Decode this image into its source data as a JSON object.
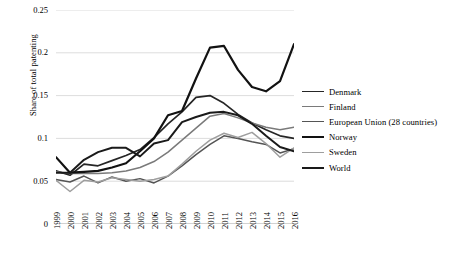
{
  "chart_data": {
    "type": "line",
    "title": "",
    "xlabel": "",
    "ylabel": "Share of total patenting",
    "ylim": [
      0,
      0.25
    ],
    "yticks": [
      "0",
      "0.05",
      "0.1",
      "0.15",
      "0.2",
      "0.25"
    ],
    "ytick_values": [
      0,
      0.05,
      0.1,
      0.15,
      0.2,
      0.25
    ],
    "grid": "horizontal",
    "legend_position": "right",
    "categories": [
      "1999",
      "2000",
      "2001",
      "2002",
      "2003",
      "2004",
      "2005",
      "2006",
      "2007",
      "2008",
      "2009",
      "2010",
      "2011",
      "2012",
      "2013",
      "2014",
      "2015",
      "2016"
    ],
    "series": [
      {
        "name": "Denmark",
        "color": "#262626",
        "width": 1.7,
        "values": [
          0.062,
          0.057,
          0.07,
          0.068,
          0.074,
          0.08,
          0.087,
          0.101,
          0.117,
          0.131,
          0.148,
          0.15,
          0.141,
          0.128,
          0.118,
          0.11,
          0.103,
          0.1
        ]
      },
      {
        "name": "Finland",
        "color": "#7a7a7a",
        "width": 1.5,
        "values": [
          0.061,
          0.059,
          0.059,
          0.059,
          0.06,
          0.062,
          0.066,
          0.073,
          0.084,
          0.098,
          0.112,
          0.126,
          0.129,
          0.124,
          0.118,
          0.113,
          0.11,
          0.113
        ]
      },
      {
        "name": "European Union (28 countries)",
        "color": "#555555",
        "width": 1.5,
        "values": [
          0.052,
          0.049,
          0.056,
          0.048,
          0.055,
          0.05,
          0.053,
          0.048,
          0.056,
          0.068,
          0.081,
          0.093,
          0.103,
          0.1,
          0.096,
          0.093,
          0.083,
          0.088
        ]
      },
      {
        "name": "Norway",
        "color": "#121212",
        "width": 2.2,
        "values": [
          0.078,
          0.06,
          0.061,
          0.062,
          0.066,
          0.071,
          0.085,
          0.1,
          0.127,
          0.132,
          0.17,
          0.206,
          0.208,
          0.18,
          0.16,
          0.155,
          0.167,
          0.21
        ]
      },
      {
        "name": "Sweden",
        "color": "#9e9e9e",
        "width": 1.5,
        "values": [
          0.051,
          0.038,
          0.051,
          0.049,
          0.054,
          0.052,
          0.05,
          0.052,
          0.056,
          0.07,
          0.085,
          0.098,
          0.106,
          0.101,
          0.107,
          0.094,
          0.078,
          0.089
        ]
      },
      {
        "name": "World",
        "color": "#1a1a1a",
        "width": 2.0,
        "values": [
          0.06,
          0.06,
          0.075,
          0.084,
          0.089,
          0.089,
          0.079,
          0.094,
          0.098,
          0.119,
          0.125,
          0.13,
          0.131,
          0.127,
          0.117,
          0.103,
          0.09,
          0.085
        ]
      }
    ]
  }
}
